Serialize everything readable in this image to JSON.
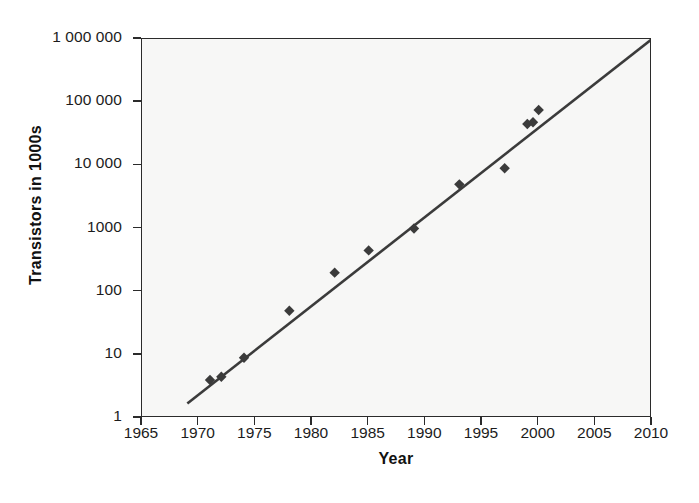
{
  "chart_data": {
    "type": "scatter",
    "title": "",
    "xlabel": "Year",
    "ylabel": "Transistors in 1000s",
    "xlim": [
      1965,
      2010
    ],
    "ylim": [
      1,
      1000000
    ],
    "yscale": "log",
    "grid": false,
    "legend": null,
    "xticks": [
      "1965",
      "1970",
      "1975",
      "1980",
      "1985",
      "1990",
      "1995",
      "2000",
      "2005",
      "2010"
    ],
    "xtick_values": [
      1965,
      1970,
      1975,
      1980,
      1985,
      1990,
      1995,
      2000,
      2005,
      2010
    ],
    "yticks": [
      "1",
      "10",
      "100",
      "1000",
      "10 000",
      "100 000",
      "1 000 000"
    ],
    "ytick_values": [
      1,
      10,
      100,
      1000,
      10000,
      100000,
      1000000
    ],
    "series": [
      {
        "name": "Transistors",
        "marker": "diamond",
        "color": "#3b3b3b",
        "points": [
          {
            "x": 1971,
            "y": 4
          },
          {
            "x": 1972,
            "y": 4.5
          },
          {
            "x": 1974,
            "y": 9
          },
          {
            "x": 1978,
            "y": 50
          },
          {
            "x": 1982,
            "y": 200
          },
          {
            "x": 1985,
            "y": 450
          },
          {
            "x": 1989,
            "y": 1000
          },
          {
            "x": 1993,
            "y": 5000
          },
          {
            "x": 1997,
            "y": 9000
          },
          {
            "x": 1999,
            "y": 45000
          },
          {
            "x": 1999.5,
            "y": 48000
          },
          {
            "x": 2000,
            "y": 75000
          }
        ]
      }
    ],
    "trendline": {
      "name": "moore-law-fit",
      "color": "#3b3b3b",
      "x_start": 1969,
      "y_start": 1.7,
      "x_end": 2010,
      "y_end": 1000000
    }
  },
  "axis": {
    "x_title": "Year",
    "y_title": "Transistors in 1000s"
  },
  "colors": {
    "plot_background": "#f7f7f6",
    "axis": "#2b2b2b",
    "marker": "#3b3b3b",
    "text": "#1c1c1c",
    "page_background": "#ffffff"
  }
}
